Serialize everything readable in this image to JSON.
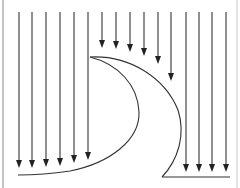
{
  "diagram": {
    "title": "",
    "colors": {
      "background": "#ffffff",
      "arrow": "#333333",
      "curve": "#333333",
      "border": "#9a9a9a"
    },
    "frame": {
      "left_x": 3,
      "right_x": 237
    },
    "arrows": {
      "left_group": [
        {
          "x": 19,
          "y1": 12,
          "y2": 168
        },
        {
          "x": 32,
          "y1": 12,
          "y2": 168
        },
        {
          "x": 46,
          "y1": 12,
          "y2": 167
        },
        {
          "x": 60,
          "y1": 12,
          "y2": 166
        },
        {
          "x": 74,
          "y1": 12,
          "y2": 163
        },
        {
          "x": 88,
          "y1": 12,
          "y2": 160
        }
      ],
      "middle_group": [
        {
          "x": 102,
          "y1": 12,
          "y2": 48
        },
        {
          "x": 116,
          "y1": 12,
          "y2": 49
        },
        {
          "x": 130,
          "y1": 12,
          "y2": 52
        },
        {
          "x": 144,
          "y1": 12,
          "y2": 56
        },
        {
          "x": 158,
          "y1": 12,
          "y2": 64
        },
        {
          "x": 171,
          "y1": 12,
          "y2": 81
        }
      ],
      "right_group": [
        {
          "x": 186,
          "y1": 12,
          "y2": 172
        },
        {
          "x": 199,
          "y1": 12,
          "y2": 172
        },
        {
          "x": 212,
          "y1": 12,
          "y2": 172
        },
        {
          "x": 226,
          "y1": 12,
          "y2": 172
        }
      ]
    },
    "shapes": {
      "crescent_label": "crescent-shaped obstacle",
      "bottom_right_line_label": "base line"
    }
  }
}
